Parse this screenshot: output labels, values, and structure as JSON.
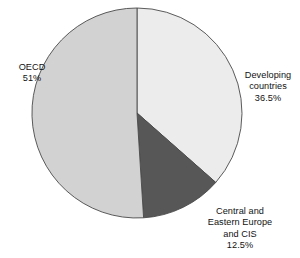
{
  "chart_data": {
    "type": "pie",
    "title": "",
    "categories": [
      "Developing countries",
      "Central and Eastern Europe and CIS",
      "OECD"
    ],
    "values": [
      36.5,
      12.5,
      51
    ],
    "unit": "%",
    "start_angle_deg": 0,
    "direction": "clockwise",
    "legend": "none",
    "labels_position": "outside",
    "colors": [
      "#ececec",
      "#575757",
      "#d2d2d2"
    ],
    "stroke": "#4a4a4a",
    "background": "#ffffff",
    "slices": [
      {
        "name": "Developing countries",
        "value": 36.5,
        "value_label": "36.5%",
        "color": "#ececec",
        "label_lines": [
          "Developing",
          "countries",
          "36.5%"
        ]
      },
      {
        "name": "Central and Eastern Europe and CIS",
        "value": 12.5,
        "value_label": "12.5%",
        "color": "#575757",
        "label_lines": [
          "Central and",
          "Eastern Europe",
          "and CIS",
          "12.5%"
        ]
      },
      {
        "name": "OECD",
        "value": 51,
        "value_label": "51%",
        "color": "#d2d2d2",
        "label_lines": [
          "OECD",
          "51%"
        ]
      }
    ]
  },
  "geometry": {
    "cx": 137,
    "cy": 113,
    "r": 105
  },
  "labels": {
    "oecd": {
      "line1": "OECD",
      "line2": "51%"
    },
    "developing": {
      "line1": "Developing",
      "line2": "countries",
      "line3": "36.5%"
    },
    "cee": {
      "line1": "Central and",
      "line2": "Eastern Europe",
      "line3": "and CIS",
      "line4": "12.5%"
    }
  }
}
